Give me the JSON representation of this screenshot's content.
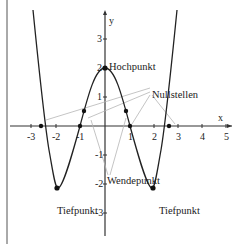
{
  "diagram": {
    "function_description": "Polynomial of degree 4 (W-shaped), symmetric about the y-axis",
    "axes": {
      "x_label": "x",
      "y_label": "y",
      "x_ticks": [
        "-3",
        "-2",
        "-1",
        "1",
        "2",
        "3",
        "4",
        "5"
      ],
      "y_ticks": [
        "3",
        "2",
        "1",
        "-1",
        "-2",
        "-3"
      ]
    },
    "annotations": {
      "maximum": "Hochpunkt",
      "zeros": "Nullstellen",
      "inflection": "Wendepunkt",
      "minimum_left": "Tiefpunkt",
      "minimum_right": "Tiefpunkt"
    },
    "points": {
      "hochpunkt": {
        "x": 0,
        "y": 2
      },
      "tiefpunkte": [
        {
          "x": -2,
          "y": -2.2
        },
        {
          "x": 2,
          "y": -2.2
        }
      ],
      "nullstellen": [
        {
          "x": -2.6
        },
        {
          "x": -1
        },
        {
          "x": 1
        },
        {
          "x": 2.6
        }
      ],
      "wendepunkte": [
        {
          "x": -0.9,
          "y": 0.55
        },
        {
          "x": 0.9,
          "y": 0.55
        }
      ]
    },
    "colors": {
      "curve": "#222222",
      "axes": "#333333",
      "leader_lines": "#b0b0b0"
    }
  }
}
